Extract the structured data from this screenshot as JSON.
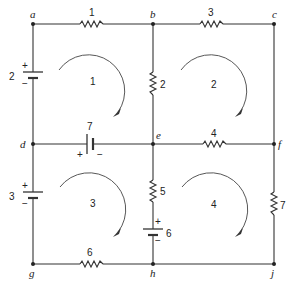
{
  "diagram": {
    "type": "circuit",
    "nodes": [
      {
        "id": "a",
        "label": "a"
      },
      {
        "id": "b",
        "label": "b"
      },
      {
        "id": "c",
        "label": "c"
      },
      {
        "id": "d",
        "label": "d"
      },
      {
        "id": "e",
        "label": "e"
      },
      {
        "id": "f",
        "label": "f"
      },
      {
        "id": "g",
        "label": "g"
      },
      {
        "id": "h",
        "label": "h"
      },
      {
        "id": "j",
        "label": "j"
      }
    ],
    "resistors": [
      {
        "id": "R1",
        "label": "1",
        "between": [
          "a",
          "b"
        ]
      },
      {
        "id": "R3",
        "label": "3",
        "between": [
          "b",
          "c"
        ]
      },
      {
        "id": "R2",
        "label": "2",
        "between": [
          "b",
          "e"
        ]
      },
      {
        "id": "R4",
        "label": "4",
        "between": [
          "e",
          "f"
        ]
      },
      {
        "id": "R5",
        "label": "5",
        "between": [
          "e",
          "h"
        ]
      },
      {
        "id": "R7",
        "label": "7",
        "between": [
          "f",
          "j"
        ]
      },
      {
        "id": "R6",
        "label": "6",
        "between": [
          "g",
          "h"
        ]
      }
    ],
    "sources": [
      {
        "id": "E2",
        "label": "2",
        "between": [
          "a",
          "d"
        ],
        "plus": "+",
        "minus": "−"
      },
      {
        "id": "E7",
        "label": "7",
        "between": [
          "d",
          "e"
        ],
        "plus": "+",
        "minus": "−"
      },
      {
        "id": "E3",
        "label": "3",
        "between": [
          "d",
          "g"
        ],
        "plus": "+",
        "minus": "−"
      },
      {
        "id": "E6",
        "label": "6",
        "between": [
          "e",
          "h"
        ],
        "plus": "+",
        "minus": "−"
      }
    ],
    "loops": [
      {
        "id": "L1",
        "label": "1",
        "direction": "clockwise"
      },
      {
        "id": "L2",
        "label": "2",
        "direction": "clockwise"
      },
      {
        "id": "L3",
        "label": "3",
        "direction": "clockwise"
      },
      {
        "id": "L4",
        "label": "4",
        "direction": "clockwise"
      }
    ]
  }
}
